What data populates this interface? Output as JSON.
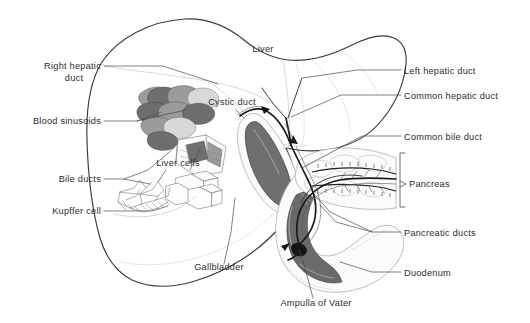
{
  "figure": {
    "width": 530,
    "height": 323,
    "background_color": "#ffffff",
    "ink_color": "#2b2b2b",
    "style": "monochrome pen-and-ink medical illustration with leader-line labels"
  },
  "labels": {
    "liver": "Liver",
    "right_hepatic_duct_line1": "Right hepatic",
    "right_hepatic_duct_line2": "duct",
    "blood_sinusoids": "Blood sinusoids",
    "bile_ducts": "Bile ducts",
    "kupffer_cell": "Kupffer cell",
    "liver_cells": "Liver cells",
    "cystic_duct": "Cystic duct",
    "gallbladder": "Gallbladder",
    "ampulla_of_vater": "Ampulla of Vater",
    "left_hepatic_duct": "Left hepatic duct",
    "common_hepatic_duct": "Common hepatic duct",
    "common_bile_duct": "Common bile duct",
    "pancreas": "Pancreas",
    "pancreatic_ducts": "Pancreatic ducts",
    "duodenum": "Duodenum"
  },
  "label_positions": {
    "liver": {
      "x": 263,
      "y": 49,
      "anchor": "middle"
    },
    "right_hepatic_duct_line1": {
      "x": 101,
      "y": 68,
      "anchor": "end"
    },
    "right_hepatic_duct_line2": {
      "x": 78,
      "y": 80,
      "anchor": "middle"
    },
    "blood_sinusoids": {
      "x": 101,
      "y": 124,
      "anchor": "end"
    },
    "bile_ducts": {
      "x": 101,
      "y": 182,
      "anchor": "end"
    },
    "kupffer_cell": {
      "x": 101,
      "y": 214,
      "anchor": "end"
    },
    "liver_cells": {
      "x": 178,
      "y": 166,
      "anchor": "middle"
    },
    "cystic_duct": {
      "x": 232,
      "y": 105,
      "anchor": "middle"
    },
    "gallbladder": {
      "x": 219,
      "y": 270,
      "anchor": "middle"
    },
    "ampulla_of_vater": {
      "x": 316,
      "y": 306,
      "anchor": "middle"
    },
    "left_hepatic_duct": {
      "x": 404,
      "y": 73,
      "anchor": "start"
    },
    "common_hepatic_duct": {
      "x": 404,
      "y": 98,
      "anchor": "start"
    },
    "common_bile_duct": {
      "x": 404,
      "y": 139,
      "anchor": "start"
    },
    "pancreas": {
      "x": 409,
      "y": 184,
      "anchor": "start"
    },
    "pancreatic_ducts": {
      "x": 404,
      "y": 235,
      "anchor": "start"
    },
    "duodenum": {
      "x": 404,
      "y": 275,
      "anchor": "start"
    }
  },
  "structures": [
    {
      "name": "liver",
      "kind": "organ",
      "shading": "outline only, pale"
    },
    {
      "name": "gallbladder",
      "kind": "organ",
      "shading": "dark grey lumen ellipse"
    },
    {
      "name": "duodenum",
      "kind": "organ",
      "shading": "dark grey lumen, C-loop"
    },
    {
      "name": "pancreas",
      "kind": "organ",
      "shading": "lobulated stipple"
    },
    {
      "name": "common-bile-duct",
      "kind": "duct"
    },
    {
      "name": "cystic-duct",
      "kind": "duct"
    },
    {
      "name": "left-hepatic-duct",
      "kind": "duct"
    },
    {
      "name": "right-hepatic-duct",
      "kind": "duct"
    },
    {
      "name": "common-hepatic-duct",
      "kind": "duct"
    },
    {
      "name": "pancreatic-ducts",
      "kind": "duct"
    },
    {
      "name": "ampulla-of-vater",
      "kind": "landmark"
    },
    {
      "name": "blood-sinusoids",
      "kind": "microanatomy-inset"
    },
    {
      "name": "liver-cells",
      "kind": "microanatomy-inset"
    },
    {
      "name": "kupffer-cell",
      "kind": "microanatomy-inset"
    },
    {
      "name": "bile-ducts",
      "kind": "microanatomy-inset"
    }
  ]
}
